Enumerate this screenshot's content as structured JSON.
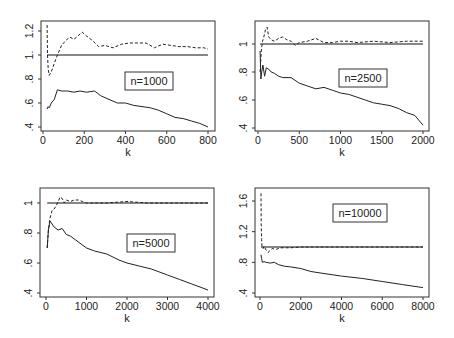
{
  "chart_data": [
    {
      "type": "line",
      "panel": "top-left",
      "legend": "n=1000",
      "xlabel": "k",
      "ylabel": "",
      "xlim": [
        0,
        800
      ],
      "ylim": [
        0.4,
        1.25
      ],
      "xticks": [
        0,
        200,
        400,
        600,
        800
      ],
      "xtick_labels": [
        "0",
        "200",
        "400",
        "600",
        "800"
      ],
      "yticks": [
        0.4,
        0.6,
        0.8,
        1.0,
        1.2
      ],
      "ytick_labels": [
        ".4",
        ".6",
        ".8",
        "1.",
        "1.2"
      ],
      "grid": false,
      "reference_line": 1.0,
      "series": [
        {
          "name": "upper (dashed)",
          "style": "dashed",
          "x": [
            20,
            22,
            25,
            30,
            40,
            55,
            70,
            90,
            110,
            130,
            150,
            170,
            190,
            210,
            240,
            270,
            300,
            340,
            380,
            420,
            460,
            500,
            540,
            580,
            620,
            660,
            700,
            740,
            780,
            800
          ],
          "y": [
            1.25,
            1.0,
            0.88,
            0.83,
            0.86,
            0.93,
            1.0,
            1.08,
            1.12,
            1.15,
            1.13,
            1.16,
            1.19,
            1.16,
            1.12,
            1.07,
            1.08,
            1.06,
            1.09,
            1.1,
            1.1,
            1.1,
            1.06,
            1.09,
            1.08,
            1.07,
            1.07,
            1.06,
            1.06,
            1.05
          ]
        },
        {
          "name": "lower (solid)",
          "style": "solid",
          "x": [
            20,
            25,
            30,
            40,
            55,
            70,
            90,
            120,
            150,
            180,
            210,
            250,
            280,
            320,
            360,
            400,
            440,
            480,
            520,
            560,
            600,
            640,
            680,
            720,
            760,
            800
          ],
          "y": [
            0.55,
            0.57,
            0.56,
            0.6,
            0.63,
            0.71,
            0.7,
            0.7,
            0.69,
            0.7,
            0.69,
            0.7,
            0.66,
            0.63,
            0.6,
            0.6,
            0.58,
            0.57,
            0.56,
            0.54,
            0.51,
            0.48,
            0.47,
            0.45,
            0.43,
            0.4
          ]
        }
      ]
    },
    {
      "type": "line",
      "panel": "top-right",
      "legend": "n=2500",
      "xlabel": "k",
      "ylabel": "",
      "xlim": [
        0,
        2000
      ],
      "ylim": [
        0.4,
        1.12
      ],
      "xticks": [
        0,
        500,
        1000,
        1500,
        2000
      ],
      "xtick_labels": [
        "0",
        "500",
        "1000",
        "1500",
        "2000"
      ],
      "yticks": [
        0.4,
        0.6,
        0.8,
        1.0
      ],
      "ytick_labels": [
        ".4",
        ".6",
        ".8",
        "1"
      ],
      "grid": false,
      "reference_line": 1.0,
      "series": [
        {
          "name": "upper (dashed)",
          "style": "dashed",
          "x": [
            25,
            40,
            55,
            70,
            90,
            110,
            130,
            160,
            200,
            250,
            300,
            350,
            400,
            450,
            500,
            600,
            700,
            800,
            900,
            1000,
            1100,
            1200,
            1400,
            1600,
            1800,
            2000
          ],
          "y": [
            0.8,
            0.95,
            1.02,
            1.05,
            1.1,
            1.12,
            1.05,
            1.03,
            1.02,
            1.04,
            1.05,
            1.03,
            1.02,
            0.99,
            1.01,
            1.02,
            1.04,
            1.01,
            1.01,
            1.02,
            1.02,
            1.01,
            1.02,
            1.01,
            1.02,
            1.02
          ]
        },
        {
          "name": "lower (solid)",
          "style": "solid",
          "x": [
            25,
            35,
            45,
            60,
            80,
            100,
            130,
            160,
            200,
            250,
            300,
            400,
            500,
            600,
            700,
            800,
            900,
            1000,
            1100,
            1200,
            1300,
            1400,
            1500,
            1600,
            1700,
            1800,
            1900,
            2000
          ],
          "y": [
            0.95,
            0.75,
            0.8,
            0.85,
            0.77,
            0.83,
            0.82,
            0.8,
            0.79,
            0.77,
            0.76,
            0.76,
            0.72,
            0.7,
            0.68,
            0.69,
            0.67,
            0.65,
            0.64,
            0.62,
            0.6,
            0.58,
            0.57,
            0.56,
            0.54,
            0.51,
            0.49,
            0.42
          ]
        }
      ]
    },
    {
      "type": "line",
      "panel": "bottom-left",
      "legend": "n=5000",
      "xlabel": "k",
      "ylabel": "",
      "xlim": [
        0,
        4000
      ],
      "ylim": [
        0.4,
        1.05
      ],
      "xticks": [
        0,
        1000,
        2000,
        3000,
        4000
      ],
      "xtick_labels": [
        "0",
        "1000",
        "2000",
        "3000",
        "4000"
      ],
      "yticks": [
        0.4,
        0.6,
        0.8,
        1.0
      ],
      "ytick_labels": [
        ".4",
        ".6",
        ".8",
        "1"
      ],
      "grid": false,
      "reference_line": 1.0,
      "series": [
        {
          "name": "upper (dashed)",
          "style": "dashed",
          "x": [
            30,
            60,
            100,
            150,
            200,
            250,
            300,
            350,
            400,
            450,
            500,
            600,
            700,
            800,
            900,
            1000,
            1200,
            1500,
            2000,
            2500,
            3000,
            3500,
            4000
          ],
          "y": [
            0.7,
            0.82,
            0.9,
            0.95,
            0.96,
            0.98,
            1.01,
            1.04,
            1.03,
            1.0,
            1.02,
            1.01,
            1.02,
            1.02,
            1.01,
            1.0,
            1.0,
            1.0,
            1.01,
            1.0,
            1.0,
            1.0,
            1.0
          ]
        },
        {
          "name": "lower (solid)",
          "style": "solid",
          "x": [
            30,
            60,
            100,
            150,
            200,
            300,
            400,
            500,
            600,
            800,
            1000,
            1200,
            1500,
            1800,
            2000,
            2300,
            2600,
            3000,
            3300,
            3600,
            4000
          ],
          "y": [
            0.7,
            0.82,
            0.88,
            0.86,
            0.84,
            0.82,
            0.83,
            0.79,
            0.78,
            0.74,
            0.7,
            0.68,
            0.66,
            0.62,
            0.6,
            0.58,
            0.56,
            0.52,
            0.49,
            0.46,
            0.42
          ]
        }
      ]
    },
    {
      "type": "line",
      "panel": "bottom-right",
      "legend": "n=10000",
      "xlabel": "k",
      "ylabel": "",
      "xlim": [
        0,
        8000
      ],
      "ylim": [
        0.4,
        1.7
      ],
      "xticks": [
        0,
        2000,
        4000,
        6000,
        8000
      ],
      "xtick_labels": [
        "0",
        "2000",
        "4000",
        "6000",
        "8000"
      ],
      "yticks": [
        0.4,
        0.8,
        1.2,
        1.6
      ],
      "ytick_labels": [
        ".4",
        ".8",
        "1.2",
        "1.6"
      ],
      "grid": false,
      "reference_line": 1.0,
      "series": [
        {
          "name": "upper (dashed)",
          "style": "dashed",
          "x": [
            50,
            60,
            80,
            100,
            150,
            200,
            300,
            400,
            600,
            800,
            1000,
            1500,
            2000,
            3000,
            4000,
            5000,
            6000,
            7000,
            8000
          ],
          "y": [
            1.7,
            1.3,
            1.1,
            1.0,
            0.98,
            1.01,
            0.96,
            0.93,
            0.98,
            0.97,
            0.99,
            0.99,
            1.0,
            1.0,
            1.0,
            1.0,
            1.0,
            1.0,
            1.0
          ]
        },
        {
          "name": "lower (solid)",
          "style": "solid",
          "x": [
            50,
            80,
            120,
            200,
            300,
            500,
            700,
            900,
            1200,
            1500,
            2000,
            2500,
            3000,
            4000,
            5000,
            6000,
            7000,
            8000
          ],
          "y": [
            0.9,
            0.85,
            0.8,
            0.81,
            0.8,
            0.79,
            0.8,
            0.77,
            0.75,
            0.74,
            0.72,
            0.68,
            0.66,
            0.62,
            0.59,
            0.55,
            0.51,
            0.47
          ]
        }
      ]
    }
  ],
  "panels": [
    {
      "legend": "n=1000",
      "xlabel": "k"
    },
    {
      "legend": "n=2500",
      "xlabel": "k"
    },
    {
      "legend": "n=5000",
      "xlabel": "k"
    },
    {
      "legend": "n=10000",
      "xlabel": "k"
    }
  ]
}
